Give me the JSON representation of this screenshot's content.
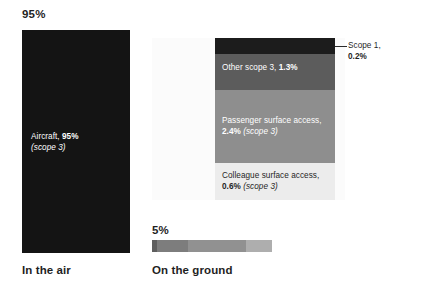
{
  "chart_data": {
    "type": "bar",
    "title": "",
    "subtitle": "",
    "xlabel": "",
    "ylabel": "",
    "orientation": "stacked",
    "groups": [
      {
        "name": "In the air",
        "total_label": "95%",
        "total_value": 95,
        "segments": [
          {
            "label": "Aircraft",
            "value_label": "95%",
            "value": 95,
            "scope": "(scope 3)",
            "color": "#141414"
          }
        ]
      },
      {
        "name": "On the ground",
        "total_label": "5%",
        "total_value": 5,
        "segments": [
          {
            "label": "Scope 1",
            "value_label": "0.2%",
            "value": 0.2,
            "scope": "",
            "color": "#1c1c1c"
          },
          {
            "label": "Other scope 3",
            "value_label": "1.3%",
            "value": 1.3,
            "scope": "",
            "color": "#5c5c5c"
          },
          {
            "label": "Passenger surface access",
            "value_label": "2.4%",
            "value": 2.4,
            "scope": "(scope 3)",
            "color": "#8e8e8e"
          },
          {
            "label": "Colleague surface access",
            "value_label": "0.6%",
            "value": 0.6,
            "scope": "(scope 3)",
            "color": "#ececec"
          }
        ]
      }
    ]
  },
  "air": {
    "percent_label": "95%",
    "bar_label_lead": "Aircraft, ",
    "bar_label_value": "95%",
    "bar_label_scope": "(scope 3)",
    "axis_label": "In the air"
  },
  "ground": {
    "percent_label": "5%",
    "axis_label": "On the ground",
    "segments": {
      "scope1": {
        "callout_line1": "Scope 1,",
        "callout_value": "0.2%"
      },
      "other": {
        "lead": "Other scope 3, ",
        "value": "1.3%",
        "scope": ""
      },
      "passenger": {
        "lead": "Passenger surface access,",
        "value": "2.4%",
        "scope": " (scope 3)"
      },
      "colleague": {
        "lead": "Colleague surface access,",
        "value": "0.6%",
        "scope": " (scope 3)"
      }
    }
  },
  "colors": {
    "aircraft": "#141414",
    "scope1": "#1c1c1c",
    "other_scope3": "#5c5c5c",
    "passenger": "#8e8e8e",
    "colleague": "#ececec",
    "panel": "#fbfbfb",
    "text": "#1f1f1f"
  }
}
